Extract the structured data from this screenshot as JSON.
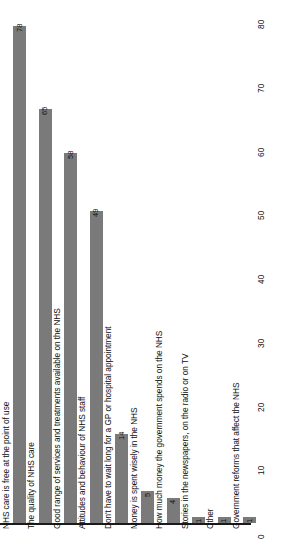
{
  "chart_data": {
    "type": "bar",
    "title": "",
    "subtitle": "",
    "xlabel": "",
    "ylabel": "",
    "orientation": "rotated-vertical",
    "grid": false,
    "legend": false,
    "bar_color": "#7a7a7a",
    "axis_color": "#1a1a1a",
    "background": "#ffffff",
    "ylim": [
      0,
      80
    ],
    "yticks": [
      0,
      10,
      20,
      30,
      40,
      50,
      60,
      70,
      80
    ],
    "ytick_labels": [
      "0",
      "10",
      "20",
      "30",
      "40",
      "50",
      "60",
      "70",
      "80"
    ],
    "categories": [
      "NHS care is free at the point of use",
      "The quality of NHS care",
      "Good range of services and treatments available on the NHS",
      "Attitudes and behaviour of NHS staff",
      "Don't have to wait long for a GP or hospital appointment",
      "Money is spent wisely in the NHS",
      "How much money the government spends on the NHS",
      "Stories in the newspapers, on the radio or on TV",
      "Other",
      "Government reforms that affect the NHS"
    ],
    "values": [
      78,
      65,
      58,
      49,
      14,
      5,
      4,
      1,
      1,
      1
    ],
    "value_labels": [
      "78",
      "65",
      "58",
      "49",
      "14",
      "5",
      "4",
      "1",
      "1",
      "1"
    ]
  }
}
